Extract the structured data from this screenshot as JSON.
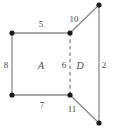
{
  "figure": {
    "width": 115,
    "height": 135,
    "background_color": "#ffffff",
    "stroke_color": "#8a8a8a",
    "vertex_color": "#1a1a1a",
    "label_color": "#4a4a4a",
    "vertices": [
      {
        "name": "top-left",
        "x": 12,
        "y": 33
      },
      {
        "name": "top-middle",
        "x": 70,
        "y": 33
      },
      {
        "name": "top-right",
        "x": 99,
        "y": 5
      },
      {
        "name": "bottom-left",
        "x": 12,
        "y": 95
      },
      {
        "name": "bottom-middle",
        "x": 70,
        "y": 95
      },
      {
        "name": "bottom-right",
        "x": 99,
        "y": 123
      }
    ],
    "edges": [
      {
        "name": "top-edge-region-a",
        "from": "top-left",
        "to": "top-middle",
        "style": "solid"
      },
      {
        "name": "left-edge-region-a",
        "from": "top-left",
        "to": "bottom-left",
        "style": "solid"
      },
      {
        "name": "bottom-edge-region-a",
        "from": "bottom-left",
        "to": "bottom-middle",
        "style": "solid"
      },
      {
        "name": "shared-edge",
        "from": "top-middle",
        "to": "bottom-middle",
        "style": "dashed"
      },
      {
        "name": "top-edge-region-d",
        "from": "top-middle",
        "to": "top-right",
        "style": "solid"
      },
      {
        "name": "right-edge-region-d",
        "from": "top-right",
        "to": "bottom-right",
        "style": "solid"
      },
      {
        "name": "bottom-edge-region-d",
        "from": "bottom-middle",
        "to": "bottom-right",
        "style": "solid"
      }
    ],
    "labels": [
      {
        "name": "edge-label-top-a",
        "text": "5",
        "x": 41,
        "y": 24,
        "kind": "length"
      },
      {
        "name": "edge-label-top-d",
        "text": "10",
        "x": 74,
        "y": 19,
        "kind": "length"
      },
      {
        "name": "edge-label-left",
        "text": "8",
        "x": 6,
        "y": 65,
        "kind": "length"
      },
      {
        "name": "region-label-a",
        "text": "A",
        "x": 41,
        "y": 65,
        "kind": "region"
      },
      {
        "name": "edge-label-shared",
        "text": "6",
        "x": 64,
        "y": 65,
        "kind": "length"
      },
      {
        "name": "region-label-d",
        "text": "D",
        "x": 80,
        "y": 65,
        "kind": "region"
      },
      {
        "name": "edge-label-right",
        "text": "2",
        "x": 104,
        "y": 65,
        "kind": "length"
      },
      {
        "name": "edge-label-bottom-a",
        "text": "7",
        "x": 42,
        "y": 105,
        "kind": "length"
      },
      {
        "name": "edge-label-bottom-d",
        "text": "11",
        "x": 72,
        "y": 109,
        "kind": "length"
      }
    ]
  }
}
